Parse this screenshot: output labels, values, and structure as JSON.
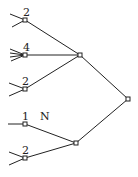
{
  "diagram": {
    "type": "tree",
    "leaf_labels": [
      "2",
      "4",
      "2",
      "1",
      "2"
    ],
    "annotation": "N",
    "nodes": [
      {
        "id": "a",
        "label": "2",
        "x": 25,
        "y": 20
      },
      {
        "id": "b",
        "label": "4",
        "x": 25,
        "y": 55
      },
      {
        "id": "c",
        "label": "2",
        "x": 25,
        "y": 89
      },
      {
        "id": "d",
        "label": "1",
        "x": 25,
        "y": 124
      },
      {
        "id": "e",
        "label": "2",
        "x": 25,
        "y": 158
      },
      {
        "id": "m1",
        "label": "",
        "x": 80,
        "y": 55
      },
      {
        "id": "m2",
        "label": "",
        "x": 76,
        "y": 143
      },
      {
        "id": "root",
        "label": "",
        "x": 128,
        "y": 99
      }
    ]
  }
}
